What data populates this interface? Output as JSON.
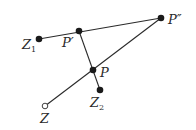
{
  "diagram": {
    "points": [
      {
        "id": "Z1",
        "label": "Z",
        "sub": "1",
        "x": 39,
        "y": 39,
        "style": "filled",
        "lx": 22,
        "ly": 49
      },
      {
        "id": "P1",
        "label": "P′",
        "sub": "",
        "x": 79,
        "y": 31,
        "style": "filled",
        "lx": 62,
        "ly": 47
      },
      {
        "id": "P2",
        "label": "P″",
        "sub": "",
        "x": 161,
        "y": 18,
        "style": "filled",
        "lx": 168,
        "ly": 24
      },
      {
        "id": "P",
        "label": "P",
        "sub": "",
        "x": 93,
        "y": 70,
        "style": "filled",
        "lx": 100,
        "ly": 77
      },
      {
        "id": "Z2",
        "label": "Z",
        "sub": "2",
        "x": 100,
        "y": 90,
        "style": "filled",
        "lx": 90,
        "ly": 108
      },
      {
        "id": "Z",
        "label": "Z",
        "sub": "",
        "x": 45,
        "y": 106,
        "style": "open",
        "lx": 40,
        "ly": 123
      }
    ],
    "segments": [
      {
        "from": "Z1",
        "to": "P2"
      },
      {
        "from": "Z",
        "to": "P2"
      },
      {
        "from": "P1",
        "to": "Z2"
      }
    ],
    "labels": {
      "Z1": "Z",
      "Z1_sub": "1",
      "Pprime": "P′",
      "Pdoubleprime": "P″",
      "P": "P",
      "Z2": "Z",
      "Z2_sub": "2",
      "Z": "Z"
    },
    "colors": {
      "line": "#2a2a2a",
      "point": "#1a1a1a",
      "background": "#ffffff"
    }
  }
}
